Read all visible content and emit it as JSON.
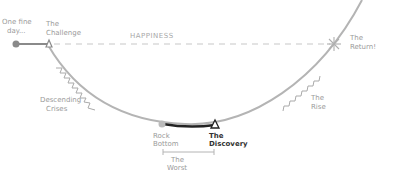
{
  "diagram": {
    "type": "story-arc",
    "labels": {
      "start_line1": "One fine",
      "start_line2": "day...",
      "challenge_line1": "The",
      "challenge_line2": "Challenge",
      "happiness": "HAPPINESS",
      "return_line1": "The",
      "return_line2": "Return!",
      "descending_line1": "Descending",
      "descending_line2": "Crises",
      "rock_line1": "Rock",
      "rock_line2": "Bottom",
      "discovery_line1": "The",
      "discovery_line2": "Discovery",
      "worst_line1": "The",
      "worst_line2": "Worst",
      "rise_line1": "The",
      "rise_line2": "Rise"
    },
    "colors": {
      "curve": "#b0b0b0",
      "dashed": "#c4c4c4",
      "highlight": "#222222",
      "label": "#9a9a9a"
    }
  }
}
